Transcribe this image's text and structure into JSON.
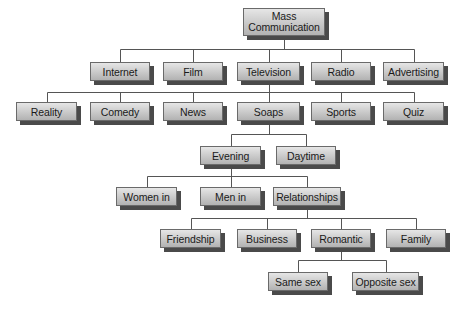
{
  "diagram": {
    "type": "hierarchy-tree",
    "root": {
      "id": "mass",
      "label_lines": [
        "Mass",
        "Communication"
      ]
    },
    "nodes": [
      {
        "id": "internet",
        "label": "Internet",
        "parent": "mass"
      },
      {
        "id": "film",
        "label": "Film",
        "parent": "mass"
      },
      {
        "id": "television",
        "label": "Television",
        "parent": "mass"
      },
      {
        "id": "radio",
        "label": "Radio",
        "parent": "mass"
      },
      {
        "id": "advertising",
        "label": "Advertising",
        "parent": "mass"
      },
      {
        "id": "reality",
        "label": "Reality",
        "parent": "television"
      },
      {
        "id": "comedy",
        "label": "Comedy",
        "parent": "television"
      },
      {
        "id": "news",
        "label": "News",
        "parent": "television"
      },
      {
        "id": "soaps",
        "label": "Soaps",
        "parent": "television"
      },
      {
        "id": "sports",
        "label": "Sports",
        "parent": "television"
      },
      {
        "id": "quiz",
        "label": "Quiz",
        "parent": "television"
      },
      {
        "id": "evening",
        "label": "Evening",
        "parent": "soaps"
      },
      {
        "id": "daytime",
        "label": "Daytime",
        "parent": "soaps"
      },
      {
        "id": "women",
        "label": "Women in",
        "parent": "evening"
      },
      {
        "id": "men",
        "label": "Men in",
        "parent": "evening"
      },
      {
        "id": "relationships",
        "label": "Relationships",
        "parent": "evening"
      },
      {
        "id": "friendship",
        "label": "Friendship",
        "parent": "relationships"
      },
      {
        "id": "business",
        "label": "Business",
        "parent": "relationships"
      },
      {
        "id": "romantic",
        "label": "Romantic",
        "parent": "relationships"
      },
      {
        "id": "family",
        "label": "Family",
        "parent": "relationships"
      },
      {
        "id": "samesex",
        "label": "Same sex",
        "parent": "romantic"
      },
      {
        "id": "oppositesex",
        "label": "Opposite sex",
        "parent": "romantic"
      }
    ]
  }
}
